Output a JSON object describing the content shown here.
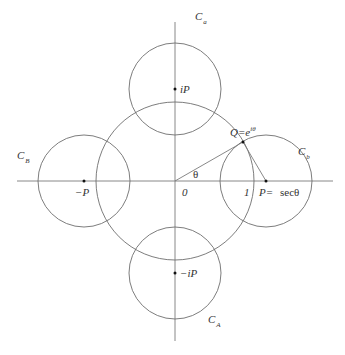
{
  "diagram": {
    "origin": {
      "x": 175,
      "y": 181
    },
    "axes": {
      "horizontal": {
        "x1": 17,
        "x2": 333,
        "y": 181
      },
      "vertical": {
        "x": 175,
        "y1": 22,
        "y2": 341
      }
    },
    "unit_circle": {
      "cx": 175,
      "cy": 181,
      "r": 79
    },
    "circles": [
      {
        "id": "C_a",
        "cx": 175,
        "cy": 89,
        "r": 46,
        "label": "C",
        "sub": "a",
        "label_x": 195,
        "label_y": 20
      },
      {
        "id": "C_b",
        "cx": 266,
        "cy": 181,
        "r": 46,
        "label": "C",
        "sub": "b",
        "label_x": 298,
        "label_y": 155
      },
      {
        "id": "C_B",
        "cx": 84,
        "cy": 181,
        "r": 46,
        "label": "C",
        "sub": "B",
        "label_x": 17,
        "label_y": 159
      },
      {
        "id": "C_A",
        "cx": 175,
        "cy": 273,
        "r": 46,
        "label": "C",
        "sub": "A",
        "label_x": 208,
        "label_y": 323
      }
    ],
    "points": [
      {
        "id": "iP",
        "x": 175,
        "y": 89,
        "label": "iP",
        "label_x": 180,
        "label_y": 93
      },
      {
        "id": "-P",
        "x": 84,
        "y": 181,
        "label": "−P",
        "label_x": 75,
        "label_y": 196
      },
      {
        "id": "-iP",
        "x": 175,
        "y": 273,
        "label": "−iP",
        "label_x": 180,
        "label_y": 277
      },
      {
        "id": "P",
        "x": 266,
        "y": 181,
        "label": "P=",
        "label_x": 259,
        "label_y": 196
      },
      {
        "id": "Q",
        "x": 243,
        "y": 142,
        "label": "Q=e",
        "label_x": 242,
        "label_y": 132
      }
    ],
    "labels": {
      "origin": "0",
      "one": "1",
      "theta": "θ",
      "sec_theta": "secθ",
      "q_exponent": "iθ"
    }
  }
}
